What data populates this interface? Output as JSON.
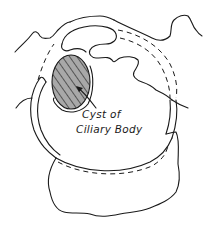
{
  "figure": {
    "type": "anatomical line drawing",
    "labels": [
      {
        "line1": "Cyst of",
        "line2": "Ciliary Body"
      }
    ],
    "colors": {
      "ink": "#1a1a1a",
      "cyst_fill": "#a8a8a8",
      "background": "#ffffff"
    }
  }
}
